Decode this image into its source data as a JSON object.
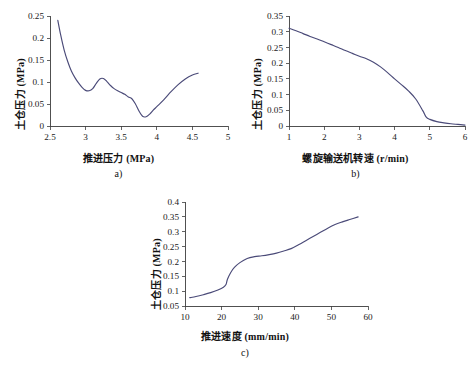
{
  "figure": {
    "background": "#ffffff",
    "line_color": "#4a4a78",
    "axis_color": "#3d3d3d"
  },
  "panels": [
    {
      "id": "a",
      "caption": "a)",
      "xlabel": "推进压力 (MPa)",
      "ylabel": "土仓压力 (MPa)",
      "xticks": [
        "2.5",
        "3",
        "3.5",
        "4",
        "4.5",
        "5"
      ],
      "yticks": [
        "0",
        "0.05",
        "0.1",
        "0.15",
        "0.2",
        "0.25"
      ]
    },
    {
      "id": "b",
      "caption": "b)",
      "xlabel": "螺旋输送机转速 (r/min)",
      "ylabel": "土仓压力 (MPa)",
      "xticks": [
        "1",
        "2",
        "3",
        "4",
        "5",
        "6"
      ],
      "yticks": [
        "0",
        "0.05",
        "0.1",
        "0.15",
        "0.2",
        "0.25",
        "0.3",
        "0.35"
      ]
    },
    {
      "id": "c",
      "caption": "c)",
      "xlabel": "推进速度 (mm/min)",
      "ylabel": "土仓压力 (MPa)",
      "xticks": [
        "10",
        "20",
        "30",
        "40",
        "50",
        "60"
      ],
      "yticks": [
        "0.05",
        "0.1",
        "0.15",
        "0.2",
        "0.25",
        "0.3",
        "0.35",
        "0.4"
      ]
    }
  ],
  "chart_data": [
    {
      "type": "line",
      "panel": "a",
      "title": "",
      "xlabel": "推进压力 (MPa)",
      "ylabel": "土仓压力 (MPa)",
      "xlim": [
        2.5,
        5
      ],
      "ylim": [
        0,
        0.25
      ],
      "xticks": [
        2.5,
        3,
        3.5,
        4,
        4.5,
        5
      ],
      "yticks": [
        0,
        0.05,
        0.1,
        0.15,
        0.2,
        0.25
      ],
      "grid": false,
      "legend": null,
      "x": [
        2.61,
        2.65,
        2.7,
        2.75,
        2.8,
        2.85,
        2.9,
        2.95,
        3.0,
        3.05,
        3.1,
        3.15,
        3.2,
        3.25,
        3.3,
        3.35,
        3.4,
        3.45,
        3.5,
        3.55,
        3.6,
        3.65,
        3.7,
        3.75,
        3.8,
        3.85,
        3.9,
        3.95,
        4.0,
        4.1,
        4.2,
        4.3,
        4.4,
        4.5,
        4.58
      ],
      "y": [
        0.24,
        0.207,
        0.172,
        0.146,
        0.125,
        0.11,
        0.098,
        0.088,
        0.081,
        0.08,
        0.085,
        0.097,
        0.107,
        0.108,
        0.101,
        0.092,
        0.085,
        0.08,
        0.076,
        0.072,
        0.066,
        0.062,
        0.05,
        0.034,
        0.022,
        0.021,
        0.027,
        0.036,
        0.044,
        0.06,
        0.078,
        0.094,
        0.107,
        0.116,
        0.12
      ]
    },
    {
      "type": "line",
      "panel": "b",
      "title": "",
      "xlabel": "螺旋输送机转速 (r/min)",
      "ylabel": "土仓压力 (MPa)",
      "xlim": [
        1,
        6
      ],
      "ylim": [
        0,
        0.35
      ],
      "xticks": [
        1,
        2,
        3,
        4,
        5,
        6
      ],
      "yticks": [
        0,
        0.05,
        0.1,
        0.15,
        0.2,
        0.25,
        0.3,
        0.35
      ],
      "grid": false,
      "legend": null,
      "x": [
        1.0,
        1.2,
        1.4,
        1.6,
        1.8,
        2.0,
        2.2,
        2.4,
        2.6,
        2.8,
        3.0,
        3.2,
        3.4,
        3.6,
        3.8,
        4.0,
        4.2,
        4.4,
        4.6,
        4.8,
        4.9,
        5.0,
        5.2,
        5.4,
        5.6,
        5.8,
        6.0
      ],
      "y": [
        0.311,
        0.303,
        0.294,
        0.285,
        0.277,
        0.268,
        0.259,
        0.25,
        0.24,
        0.231,
        0.222,
        0.214,
        0.203,
        0.188,
        0.17,
        0.15,
        0.131,
        0.111,
        0.086,
        0.049,
        0.028,
        0.021,
        0.014,
        0.01,
        0.007,
        0.005,
        0.003
      ]
    },
    {
      "type": "line",
      "panel": "c",
      "title": "",
      "xlabel": "推进速度 (mm/min)",
      "ylabel": "土仓压力 (MPa)",
      "xlim": [
        10,
        60
      ],
      "ylim": [
        0.05,
        0.4
      ],
      "xticks": [
        10,
        20,
        30,
        40,
        50,
        60
      ],
      "yticks": [
        0.05,
        0.1,
        0.15,
        0.2,
        0.25,
        0.3,
        0.35,
        0.4
      ],
      "grid": false,
      "legend": null,
      "x": [
        11.3,
        13.0,
        15.0,
        17.0,
        19.0,
        20.5,
        21.2,
        21.6,
        22.5,
        23.5,
        25.0,
        27.0,
        29.0,
        31.0,
        33.0,
        35.0,
        37.0,
        39.0,
        41.0,
        43.0,
        45.0,
        47.0,
        49.0,
        51.0,
        53.0,
        55.0,
        57.3
      ],
      "y": [
        0.078,
        0.082,
        0.088,
        0.095,
        0.104,
        0.113,
        0.122,
        0.14,
        0.163,
        0.18,
        0.196,
        0.21,
        0.216,
        0.219,
        0.223,
        0.228,
        0.235,
        0.243,
        0.256,
        0.27,
        0.284,
        0.298,
        0.312,
        0.324,
        0.333,
        0.341,
        0.35
      ]
    }
  ]
}
